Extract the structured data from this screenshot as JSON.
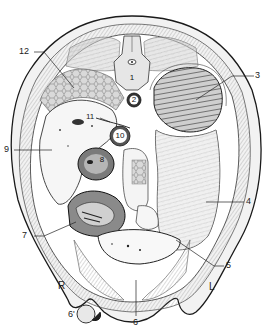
{
  "figure": {
    "type": "anatomical-cross-section",
    "style": "black-and-white engraving",
    "labels": [
      {
        "id": "1",
        "text": "1"
      },
      {
        "id": "2",
        "text": "2"
      },
      {
        "id": "3",
        "text": "3"
      },
      {
        "id": "4",
        "text": "4"
      },
      {
        "id": "5",
        "text": "5"
      },
      {
        "id": "6",
        "text": "6"
      },
      {
        "id": "6p",
        "text": "6'"
      },
      {
        "id": "7",
        "text": "7"
      },
      {
        "id": "8",
        "text": "8"
      },
      {
        "id": "9",
        "text": "9"
      },
      {
        "id": "10",
        "text": "10"
      },
      {
        "id": "11",
        "text": "11"
      },
      {
        "id": "12",
        "text": "12"
      }
    ],
    "orientation": {
      "right": "R",
      "left": "L"
    }
  },
  "colors": {
    "outline": "#1a1a1a",
    "tissue_light": "#e8e8e8",
    "tissue_mid": "#bdbdbd",
    "tissue_dark": "#555555",
    "background": "#ffffff"
  }
}
